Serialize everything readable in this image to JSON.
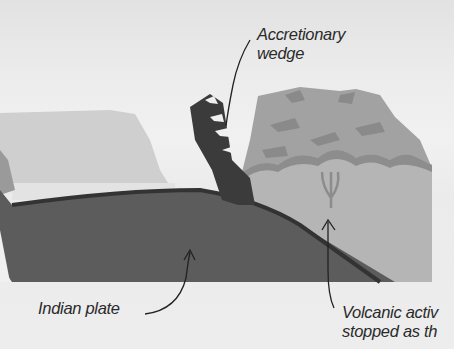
{
  "diagram": {
    "type": "cross-section illustration",
    "labels": {
      "accretionary_wedge": [
        "Accretionary",
        "wedge"
      ],
      "indian_plate": "Indian plate",
      "volcanic_activity": [
        "Volcanic activ",
        "stopped as th"
      ]
    },
    "colors": {
      "sky": "#ececec",
      "plate_dark": "#5a5a5a",
      "plate_outline": "#3a3a3a",
      "continental_block": "#8e8e8e",
      "crust_light": "#a9a9a9",
      "wedge": "#3e3e3e",
      "label_text": "#2a2a2a"
    }
  }
}
